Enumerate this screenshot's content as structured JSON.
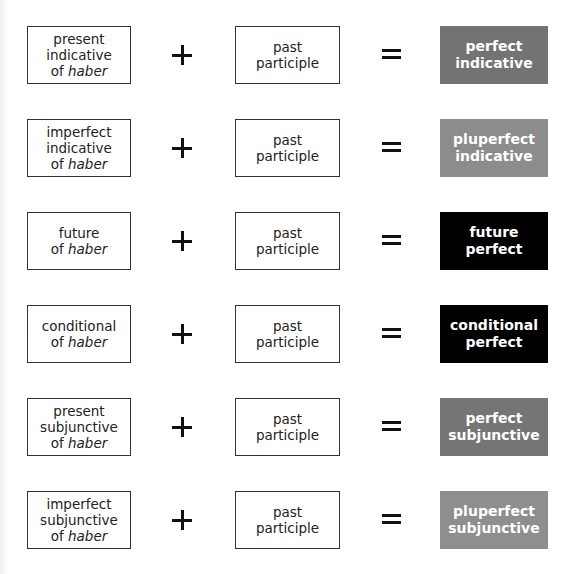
{
  "diagram": {
    "rows": [
      {
        "aux": {
          "lines": [
            "present",
            "indicative"
          ],
          "of": "of ",
          "haber": "haber"
        },
        "plus": "+",
        "participle": {
          "lines": [
            "past",
            "participle"
          ]
        },
        "equals": "=",
        "result": {
          "lines": [
            "perfect",
            "indicative"
          ],
          "color": "#737373"
        }
      },
      {
        "aux": {
          "lines": [
            "imperfect",
            "indicative"
          ],
          "of": "of ",
          "haber": "haber"
        },
        "plus": "+",
        "participle": {
          "lines": [
            "past",
            "participle"
          ]
        },
        "equals": "=",
        "result": {
          "lines": [
            "pluperfect",
            "indicative"
          ],
          "color": "#8c8c8c"
        }
      },
      {
        "aux": {
          "lines": [
            "future"
          ],
          "of": "of ",
          "haber": "haber"
        },
        "plus": "+",
        "participle": {
          "lines": [
            "past",
            "participle"
          ]
        },
        "equals": "=",
        "result": {
          "lines": [
            "future",
            "perfect"
          ],
          "color": "#000000"
        }
      },
      {
        "aux": {
          "lines": [
            "conditional"
          ],
          "of": "of ",
          "haber": "haber"
        },
        "plus": "+",
        "participle": {
          "lines": [
            "past",
            "participle"
          ]
        },
        "equals": "=",
        "result": {
          "lines": [
            "conditional",
            "perfect"
          ],
          "color": "#000000"
        }
      },
      {
        "aux": {
          "lines": [
            "present",
            "subjunctive"
          ],
          "of": "of ",
          "haber": "haber"
        },
        "plus": "+",
        "participle": {
          "lines": [
            "past",
            "participle"
          ]
        },
        "equals": "=",
        "result": {
          "lines": [
            "perfect",
            "subjunctive"
          ],
          "color": "#757575"
        }
      },
      {
        "aux": {
          "lines": [
            "imperfect",
            "subjunctive"
          ],
          "of": "of ",
          "haber": "haber"
        },
        "plus": "+",
        "participle": {
          "lines": [
            "past",
            "participle"
          ]
        },
        "equals": "=",
        "result": {
          "lines": [
            "pluperfect",
            "subjunctive"
          ],
          "color": "#8e8e8e"
        }
      }
    ]
  }
}
